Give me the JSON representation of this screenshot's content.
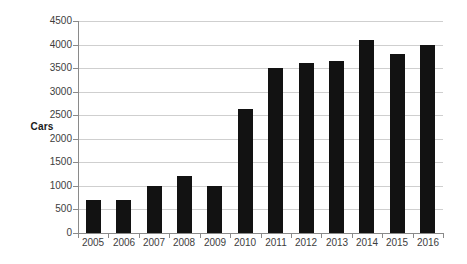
{
  "chart_data": {
    "type": "bar",
    "title": "",
    "xlabel": "",
    "ylabel": "Cars",
    "categories": [
      "2005",
      "2006",
      "2007",
      "2008",
      "2009",
      "2010",
      "2011",
      "2012",
      "2013",
      "2014",
      "2015",
      "2016"
    ],
    "values": [
      700,
      700,
      1000,
      1200,
      1000,
      2630,
      3500,
      3600,
      3650,
      4100,
      3800,
      4000
    ],
    "ylim": [
      0,
      4500
    ],
    "y_ticks": [
      0,
      500,
      1000,
      1500,
      2000,
      2500,
      3000,
      3500,
      4000,
      4500
    ],
    "y_tick_labels": [
      "0",
      "500",
      "1000",
      "1500",
      "2000",
      "2500",
      "3000",
      "3500",
      "4000",
      "4500"
    ],
    "grid": true,
    "grid_axis": "y",
    "legend": false,
    "legend_position": "none",
    "bar_color": "#121212",
    "grid_color": "#cfcfcf",
    "axis_color": "#8a8a8a",
    "background_color": "#ffffff",
    "text_color": "#3d3d3d"
  }
}
